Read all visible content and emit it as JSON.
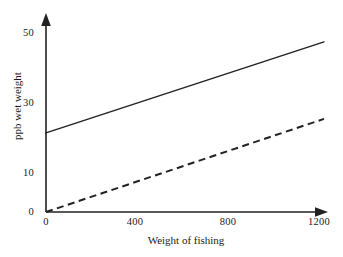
{
  "chart_data": {
    "type": "line",
    "title": "",
    "xlabel": "Weight of fishing",
    "ylabel": "ppb wet weight",
    "xlim": [
      0,
      1200
    ],
    "ylim": [
      0,
      52
    ],
    "xticks": [
      0,
      400,
      800,
      1200
    ],
    "yticks": [
      0,
      10,
      30,
      50
    ],
    "xtick_labels": [
      "0",
      "400",
      "800",
      "1200"
    ],
    "ytick_labels": [
      "0",
      "10",
      "30",
      "50"
    ],
    "grid": false,
    "legend": "none",
    "axis_arrows": true,
    "series": [
      {
        "name": "solid-line",
        "style": "solid",
        "color": "#222222",
        "x": [
          0,
          1200
        ],
        "values": [
          22.6,
          48.6
        ]
      },
      {
        "name": "dashed-line",
        "style": "dashed",
        "color": "#222222",
        "x": [
          0,
          1200
        ],
        "values": [
          0,
          26.6
        ]
      }
    ]
  },
  "axes": {
    "x_title": "Weight of fishing",
    "y_title": "ppb wet weight"
  },
  "ytick_items": [
    {
      "label": "50",
      "top": 27
    },
    {
      "label": "30",
      "top": 97
    },
    {
      "label": "10",
      "top": 167
    },
    {
      "label": "0",
      "top": 206
    }
  ],
  "xtick_items": [
    {
      "label": "0",
      "left": 26
    },
    {
      "label": "400",
      "left": 115
    },
    {
      "label": "800",
      "left": 208
    },
    {
      "label": "1200",
      "left": 299
    }
  ]
}
